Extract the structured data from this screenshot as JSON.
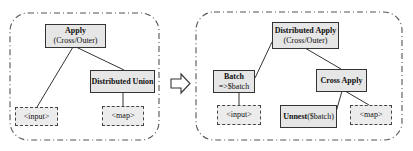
{
  "diagram": {
    "left_panel": {
      "nodes": {
        "apply": {
          "title": "Apply",
          "subtitle": "(Cross/Outer)"
        },
        "distributed_union": {
          "title": "Distributed Union"
        },
        "input": {
          "label": "<input>"
        },
        "map": {
          "label": "<map>"
        }
      }
    },
    "transform_arrow": "⇨",
    "right_panel": {
      "nodes": {
        "distributed_apply": {
          "title": "Distributed Apply",
          "subtitle": "(Cross/Outer)"
        },
        "batch": {
          "title": "Batch",
          "subtitle": "=>$batch"
        },
        "cross_apply": {
          "title": "Cross Apply"
        },
        "input": {
          "label": "<input>"
        },
        "unnest": {
          "title": "Unnest",
          "arg": "($batch)"
        },
        "map": {
          "label": "<map>"
        }
      }
    },
    "colors": {
      "node_fill": "#e6e6e6",
      "border": "#333333",
      "panel_border": "#555555"
    }
  }
}
